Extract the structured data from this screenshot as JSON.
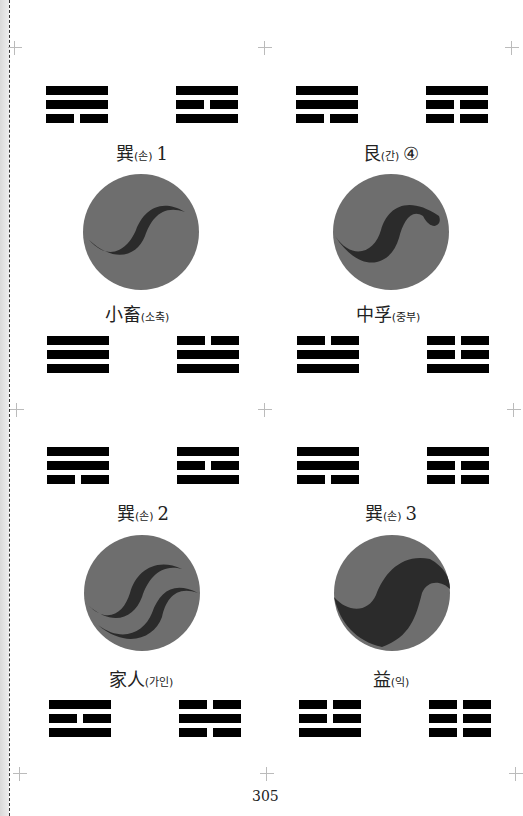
{
  "page": {
    "page_number": "305",
    "colors": {
      "line": "#000000",
      "circle_light": "#6e6e6e",
      "circle_dark": "#2b2b2b",
      "gutter": "#e0e0e0"
    }
  },
  "panels": [
    {
      "title": {
        "han": "巽",
        "kor": "(손)",
        "num": "1"
      },
      "top_trigrams": {
        "left": [
          "solid",
          "solid",
          "broken"
        ],
        "right": [
          "solid",
          "broken",
          "solid"
        ]
      },
      "symbol": "single-s-curve",
      "hexagram": {
        "han": "小畜",
        "kor": "(소축)"
      },
      "bottom_trigrams": {
        "left": [
          "solid",
          "solid",
          "solid"
        ],
        "right": [
          "broken",
          "solid",
          "solid"
        ]
      }
    },
    {
      "title": {
        "han": "艮",
        "kor": "(간)",
        "num": "④"
      },
      "top_trigrams": {
        "left": [
          "solid",
          "solid",
          "broken"
        ],
        "right": [
          "solid",
          "broken",
          "broken"
        ]
      },
      "symbol": "thick-s-curve",
      "hexagram": {
        "han": "中孚",
        "kor": "(중부)"
      },
      "bottom_trigrams": {
        "left": [
          "broken",
          "solid",
          "solid"
        ],
        "right": [
          "broken",
          "broken",
          "solid"
        ]
      }
    },
    {
      "title": {
        "han": "巽",
        "kor": "(손)",
        "num": "2"
      },
      "top_trigrams": {
        "left": [
          "solid",
          "solid",
          "broken"
        ],
        "right": [
          "solid",
          "broken",
          "solid"
        ]
      },
      "symbol": "double-s-curve",
      "hexagram": {
        "han": "家人",
        "kor": "(가인)"
      },
      "bottom_trigrams": {
        "left": [
          "solid",
          "broken",
          "solid"
        ],
        "right": [
          "broken",
          "solid",
          "broken"
        ]
      }
    },
    {
      "title": {
        "han": "巽",
        "kor": "(손)",
        "num": "3"
      },
      "top_trigrams": {
        "left": [
          "solid",
          "solid",
          "broken"
        ],
        "right": [
          "solid",
          "broken",
          "broken"
        ]
      },
      "symbol": "wide-s-curve",
      "hexagram": {
        "han": "益",
        "kor": "(익)"
      },
      "bottom_trigrams": {
        "left": [
          "broken",
          "broken",
          "solid"
        ],
        "right": [
          "broken",
          "broken",
          "broken"
        ]
      }
    }
  ]
}
